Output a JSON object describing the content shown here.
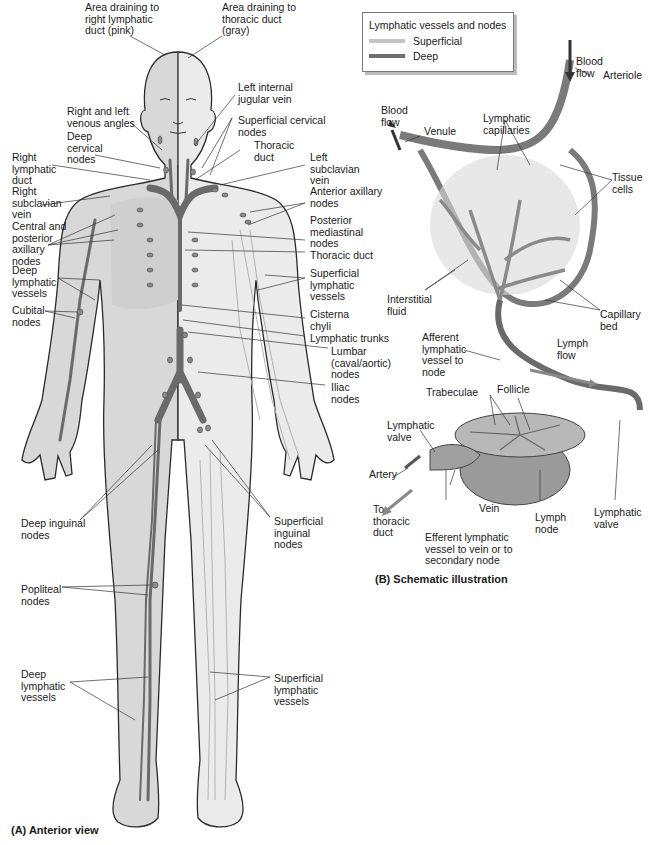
{
  "legend": {
    "title": "Lymphatic vessels and nodes",
    "items": [
      {
        "label": "Superficial",
        "color": "#c4c4c4"
      },
      {
        "label": "Deep",
        "color": "#6e6e6e"
      }
    ]
  },
  "panel_a": {
    "caption": "(A)  Anterior view",
    "labels": {
      "area_right": "Area draining to\nright lymphatic\nduct (pink)",
      "area_thoracic": "Area draining to\nthoracic duct\n(gray)",
      "left_internal_jugular": "Left internal\njugular vein",
      "venous_angles": "Right and left\nvenous angles",
      "superficial_cervical": "Superficial cervical\nnodes",
      "deep_cervical": "Deep\ncervical\nnodes",
      "thoracic_duct_top": "Thoracic\nduct",
      "right_lymphatic_duct": "Right\nlymphatic\nduct",
      "left_subclavian": "Left\nsubclavian\nvein",
      "right_subclavian": "Right\nsubclavian\nvein",
      "anterior_axillary": "Anterior axillary\nnodes",
      "central_posterior_axillary": "Central and\nposterior\naxillary\nnodes",
      "posterior_mediastinal": "Posterior\nmediastinal\nnodes",
      "thoracic_duct": "Thoracic duct",
      "deep_vessels_arm": "Deep\nlymphatic\nvessels",
      "superficial_vessels_arm": "Superficial\nlymphatic\nvessels",
      "cubital": "Cubital\nnodes",
      "cisterna_chyli": "Cisterna\nchyli",
      "lymphatic_trunks": "Lymphatic trunks",
      "lumbar": "Lumbar\n(caval/aortic)\nnodes",
      "iliac": "Iliac\nnodes",
      "deep_inguinal": "Deep inguinal\nnodes",
      "superficial_inguinal": "Superficial\ninguinal\nnodes",
      "popliteal": "Popliteal\nnodes",
      "deep_vessels_leg": "Deep\nlymphatic\nvessels",
      "superficial_vessels_leg": "Superficial\nlymphatic\nvessels"
    }
  },
  "panel_b": {
    "caption": "(B)  Schematic illustration",
    "labels": {
      "blood_flow_right": "Blood\nflow",
      "arteriole": "Arteriole",
      "blood_flow_left": "Blood\nflow",
      "venule": "Venule",
      "lymphatic_capillaries": "Lymphatic\ncapillaries",
      "tissue_cells": "Tissue\ncells",
      "interstitial_fluid": "Interstitial\nfluid",
      "capillary_bed": "Capillary\nbed",
      "afferent": "Afferent\nlymphatic\nvessel to\nnode",
      "lymph_flow": "Lymph\nflow",
      "follicle": "Follicle",
      "trabeculae": "Trabeculae",
      "lymphatic_valve_left": "Lymphatic\nvalve",
      "artery": "Artery",
      "vein": "Vein",
      "to_thoracic_duct": "To\nthoracic\nduct",
      "efferent": "Efferent lymphatic\nvessel to vein or to\nsecondary node",
      "lymph_node": "Lymph\nnode",
      "lymphatic_valve_right": "Lymphatic\nvalve"
    }
  },
  "colors": {
    "body_right": "#d6d6d6",
    "body_left": "#e4e4e4",
    "outline": "#2a2a2a",
    "deep_vessel": "#6e6e6e",
    "superficial_vessel": "#b0b0b0",
    "node": "#8a8a8a"
  }
}
